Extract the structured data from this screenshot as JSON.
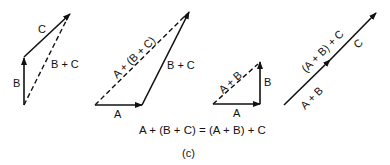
{
  "figure": {
    "caption": "(c)",
    "equation": "A + (B + C) = (A + B) + C",
    "colors": {
      "stroke": "#111111",
      "background": "#ffffff"
    }
  },
  "panels": [
    {
      "id": "panel-1",
      "vectors": [
        {
          "label": "B",
          "style": "solid"
        },
        {
          "label": "C",
          "style": "solid"
        },
        {
          "label": "B + C",
          "style": "dashed"
        }
      ]
    },
    {
      "id": "panel-2",
      "vectors": [
        {
          "label": "A",
          "style": "solid"
        },
        {
          "label": "B + C",
          "style": "solid"
        },
        {
          "label": "A + (B + C)",
          "style": "dashed"
        }
      ]
    },
    {
      "id": "panel-3",
      "vectors": [
        {
          "label": "A",
          "style": "solid"
        },
        {
          "label": "B",
          "style": "solid"
        },
        {
          "label": "A + B",
          "style": "dashed"
        }
      ]
    },
    {
      "id": "panel-4",
      "vectors": [
        {
          "label": "A + B",
          "style": "solid"
        },
        {
          "label": "C",
          "style": "solid"
        },
        {
          "label": "(A + B) + C",
          "style": "solid"
        }
      ]
    }
  ]
}
